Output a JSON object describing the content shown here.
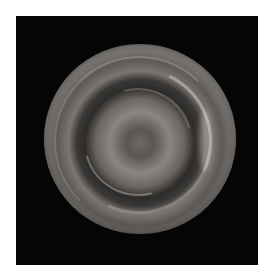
{
  "image": {
    "subject": "planet polar vortex",
    "description": "Grayscale image of a planet's polar region showing a swirling central vortex surrounded by concentric cloud bands on a black background",
    "colors": {
      "background": "#050505",
      "page": "#ffffff"
    }
  }
}
